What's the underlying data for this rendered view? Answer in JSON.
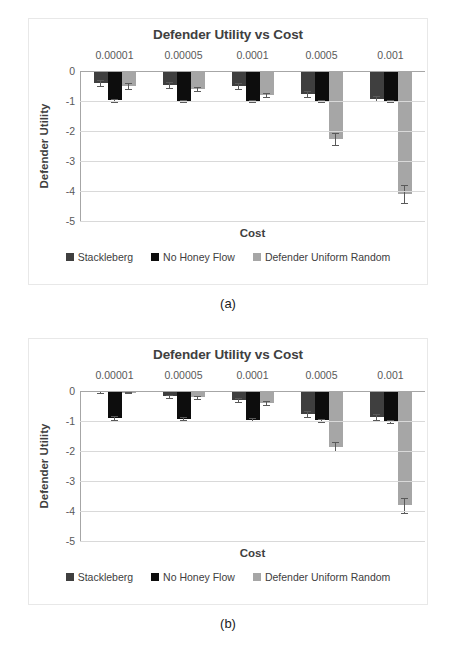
{
  "figure": {
    "panels": [
      {
        "caption": "(a)",
        "title": "Defender Utility vs Cost",
        "chart_data": {
          "type": "bar",
          "title": "Defender Utility vs Cost",
          "xlabel": "Cost",
          "ylabel": "Defender Utility",
          "categories": [
            "0.00001",
            "0.00005",
            "0.0001",
            "0.0005",
            "0.001"
          ],
          "yticks": [
            "0",
            "-1",
            "-2",
            "-3",
            "-4",
            "-5"
          ],
          "ylim": [
            -5,
            0
          ],
          "grid": true,
          "legend_position": "bottom",
          "category_labels_position": "top",
          "series": [
            {
              "name": "Stackleberg",
              "color": "#3f3f3f",
              "values": [
                -0.4,
                -0.45,
                -0.5,
                -0.75,
                -0.92
              ],
              "errors": [
                0.1,
                0.1,
                0.1,
                0.1,
                0.08
              ]
            },
            {
              "name": "No Honey Flow",
              "color": "#0d0d0d",
              "values": [
                -0.98,
                -1.0,
                -1.0,
                -1.0,
                -1.0
              ],
              "errors": [
                0.04,
                0.04,
                0.04,
                0.04,
                0.04
              ]
            },
            {
              "name": "Defender Uniform Random",
              "color": "#a6a6a6",
              "values": [
                -0.5,
                -0.6,
                -0.8,
                -2.25,
                -4.1
              ],
              "errors": [
                0.1,
                0.08,
                0.08,
                0.2,
                0.3
              ]
            }
          ]
        }
      },
      {
        "caption": "(b)",
        "title": "Defender Utility vs Cost",
        "chart_data": {
          "type": "bar",
          "title": "Defender Utility vs Cost",
          "xlabel": "Cost",
          "ylabel": "Defender Utility",
          "categories": [
            "0.00001",
            "0.00005",
            "0.0001",
            "0.0005",
            "0.001"
          ],
          "yticks": [
            "0",
            "-1",
            "-2",
            "-3",
            "-4",
            "-5"
          ],
          "ylim": [
            -5,
            0
          ],
          "grid": true,
          "legend_position": "bottom",
          "category_labels_position": "top",
          "series": [
            {
              "name": "Stackleberg",
              "color": "#3f3f3f",
              "values": [
                -0.04,
                -0.18,
                -0.3,
                -0.75,
                -0.85
              ],
              "errors": [
                0.03,
                0.05,
                0.06,
                0.1,
                0.1
              ]
            },
            {
              "name": "No Honey Flow",
              "color": "#0d0d0d",
              "values": [
                -0.9,
                -0.92,
                -0.95,
                -0.98,
                -1.0
              ],
              "errors": [
                0.07,
                0.06,
                0.05,
                0.05,
                0.05
              ]
            },
            {
              "name": "Defender Uniform Random",
              "color": "#a6a6a6",
              "values": [
                -0.05,
                -0.2,
                -0.4,
                -1.85,
                -3.8
              ],
              "errors": [
                0.03,
                0.05,
                0.06,
                0.15,
                0.25
              ]
            }
          ]
        }
      }
    ]
  }
}
